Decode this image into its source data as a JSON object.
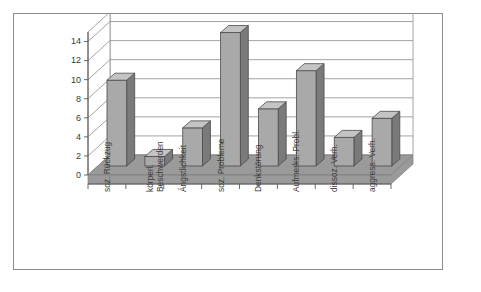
{
  "figure": {
    "name": "3d-bar-chart-figure",
    "background_color": "#ffffff",
    "frame_color": "#8d8d8d"
  },
  "chart_data": {
    "type": "bar",
    "title": "",
    "subtitle": "",
    "xlabel": "",
    "ylabel": "",
    "categories": [
      "soz. Rückzug",
      "körperl. Beschwerden",
      "Ängstlichkeit",
      "soz. Probleme",
      "Denkstörung",
      "Aufmerks.-Probl.",
      "dissoz. Verh.",
      "aggress. Verh."
    ],
    "category_lines": [
      [
        "soz. Rückzug"
      ],
      [
        "körperl.",
        "Beschwerden"
      ],
      [
        "Ängstlichkeit"
      ],
      [
        "soz. Probleme"
      ],
      [
        "Denkstörung"
      ],
      [
        "Aufmerks.-Probl."
      ],
      [
        "dissoz. Verh."
      ],
      [
        "aggress. Verh."
      ]
    ],
    "values": [
      9,
      1,
      4,
      14,
      6,
      10,
      3,
      5
    ],
    "ylim": [
      0,
      15
    ],
    "yticks": [
      0,
      2,
      4,
      6,
      8,
      10,
      12,
      14
    ],
    "ytick_labels": [
      "0",
      "2",
      "4",
      "6",
      "8",
      "10",
      "12",
      "14"
    ],
    "grid": true,
    "grid_axis": "y",
    "legend": false,
    "legend_position": "none",
    "three_d": true,
    "bar_colors": {
      "front": "#a9a9a9",
      "side": "#7a7a7a",
      "top": "#c4c4c4",
      "edge": "#4a4a4a"
    },
    "floor_color": "#9a9a9a",
    "wall_color": "#ffffff",
    "gridline_color": "#8d8d8d",
    "axis_color": "#5a5a5a"
  }
}
